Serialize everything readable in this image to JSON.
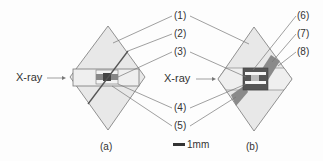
{
  "diagram": {
    "panels": [
      {
        "id": "a",
        "caption": "(a)",
        "xray_label": "X-ray"
      },
      {
        "id": "b",
        "caption": "(b)",
        "xray_label": "X-ray"
      }
    ],
    "callouts": [
      "(1)",
      "(2)",
      "(3)",
      "(4)",
      "(5)",
      "(6)",
      "(7)",
      "(8)"
    ],
    "scale_bar": {
      "label": "1mm"
    },
    "colors": {
      "fill_light": "#e6e6e6",
      "fill_dark": "#7a7a7a",
      "stroke": "#666666",
      "sample": "#444444"
    }
  }
}
